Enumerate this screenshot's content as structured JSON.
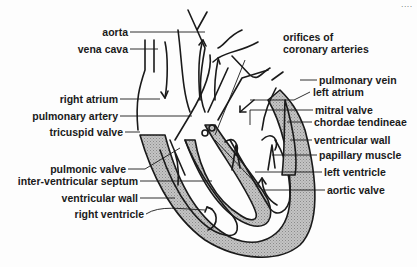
{
  "figure": {
    "type": "anatomical-diagram",
    "corner_text": "....",
    "colors": {
      "ink": "#1a1a1a",
      "muscle_shade": "#b8b8b8",
      "background": "#fdfdfd"
    }
  },
  "labels_left": [
    {
      "id": "aorta",
      "text": "aorta"
    },
    {
      "id": "vena-cava",
      "text": "vena cava"
    },
    {
      "id": "right-atrium",
      "text": "right atrium"
    },
    {
      "id": "pulmonary-artery",
      "text": "pulmonary artery"
    },
    {
      "id": "tricuspid-valve",
      "text": "tricuspid valve"
    },
    {
      "id": "pulmonic-valve",
      "text": "pulmonic valve"
    },
    {
      "id": "inter-ventricular-septum",
      "text": "inter-ventricular septum"
    },
    {
      "id": "ventricular-wall-right",
      "text": "ventricular wall"
    },
    {
      "id": "right-ventricle",
      "text": "right ventricle"
    }
  ],
  "labels_right": [
    {
      "id": "orifices-coronary",
      "text": "orifices of",
      "text2": "coronary arteries"
    },
    {
      "id": "pulmonary-vein",
      "text": "pulmonary vein"
    },
    {
      "id": "left-atrium",
      "text": "left atrium"
    },
    {
      "id": "mitral-valve",
      "text": "mitral valve"
    },
    {
      "id": "chordae-tendineae",
      "text": "chordae tendineae"
    },
    {
      "id": "ventricular-wall-left",
      "text": "ventricular wall"
    },
    {
      "id": "papillary-muscle",
      "text": "papillary muscle"
    },
    {
      "id": "left-ventricle",
      "text": "left ventricle"
    },
    {
      "id": "aortic-valve",
      "text": "aortic valve"
    }
  ]
}
